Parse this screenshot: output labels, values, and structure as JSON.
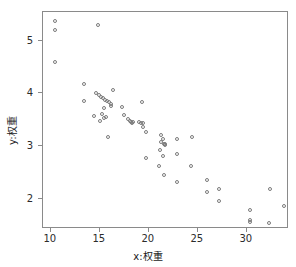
{
  "chart_data": {
    "type": "scatter",
    "title": "",
    "xlabel": "x:权重",
    "ylabel": "y:权重",
    "xlim": [
      9.2,
      34.3
    ],
    "ylim": [
      1.42,
      5.55
    ],
    "xticks": [
      10,
      15,
      20,
      25,
      30
    ],
    "xtick_labels": [
      "10",
      "15",
      "20",
      "25",
      "30"
    ],
    "yticks": [
      2,
      3,
      4,
      5
    ],
    "ytick_labels": [
      "2",
      "3",
      "4",
      "5"
    ],
    "grid": false,
    "legend": null,
    "marker": "open-circle",
    "marker_color": "#7b7b7b",
    "frame_color": "#8a8a8a",
    "background": "#ffffff",
    "n_points": 62,
    "points": [
      [
        10.4,
        5.37
      ],
      [
        10.4,
        5.21
      ],
      [
        14.8,
        5.31
      ],
      [
        10.4,
        4.6
      ],
      [
        13.4,
        4.18
      ],
      [
        13.4,
        3.86
      ],
      [
        14.6,
        4.0
      ],
      [
        14.9,
        3.97
      ],
      [
        15.1,
        3.94
      ],
      [
        15.3,
        3.91
      ],
      [
        15.5,
        3.88
      ],
      [
        15.7,
        3.86
      ],
      [
        15.9,
        3.83
      ],
      [
        16.1,
        3.8
      ],
      [
        16.3,
        4.07
      ],
      [
        15.4,
        3.73
      ],
      [
        16.1,
        3.77
      ],
      [
        17.3,
        3.74
      ],
      [
        19.3,
        3.84
      ],
      [
        14.4,
        3.58
      ],
      [
        15.2,
        3.6
      ],
      [
        15.6,
        3.56
      ],
      [
        15.0,
        3.47
      ],
      [
        15.4,
        3.53
      ],
      [
        17.5,
        3.59
      ],
      [
        17.9,
        3.52
      ],
      [
        18.1,
        3.47
      ],
      [
        18.2,
        3.45
      ],
      [
        18.4,
        3.46
      ],
      [
        19.0,
        3.45
      ],
      [
        19.2,
        3.44
      ],
      [
        19.4,
        3.44
      ],
      [
        19.4,
        3.36
      ],
      [
        15.8,
        3.17
      ],
      [
        19.7,
        3.27
      ],
      [
        21.2,
        3.21
      ],
      [
        21.4,
        3.14
      ],
      [
        22.9,
        3.14
      ],
      [
        24.4,
        3.18
      ],
      [
        21.2,
        3.07
      ],
      [
        21.6,
        3.04
      ],
      [
        21.6,
        3.02
      ],
      [
        21.1,
        2.93
      ],
      [
        21.4,
        2.8
      ],
      [
        22.9,
        2.84
      ],
      [
        19.7,
        2.77
      ],
      [
        21.0,
        2.62
      ],
      [
        24.3,
        2.61
      ],
      [
        21.5,
        2.45
      ],
      [
        22.9,
        2.32
      ],
      [
        25.9,
        2.35
      ],
      [
        25.9,
        2.13
      ],
      [
        27.2,
        2.19
      ],
      [
        32.4,
        2.18
      ],
      [
        27.2,
        1.95
      ],
      [
        33.8,
        1.85
      ],
      [
        30.3,
        1.78
      ],
      [
        30.3,
        1.6
      ],
      [
        30.3,
        1.55
      ],
      [
        32.3,
        1.54
      ],
      [
        18.3,
        3.44
      ],
      [
        21.5,
        3.03
      ]
    ]
  },
  "figure": {
    "axis_label_x": "x:权重",
    "axis_label_y": "y:权重"
  }
}
